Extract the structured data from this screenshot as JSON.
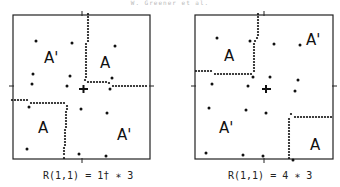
{
  "header": {
    "text": "W. Greener et al."
  },
  "panels": [
    {
      "id": "left",
      "caption": "R(1,1) = 1† ∗ 3",
      "regions": [
        {
          "label": "A'",
          "x": 44,
          "y": 58
        },
        {
          "label": "A",
          "x": 101,
          "y": 63
        },
        {
          "label": "A",
          "x": 40,
          "y": 131
        },
        {
          "label": "A'",
          "x": 117,
          "y": 138
        }
      ]
    },
    {
      "id": "right",
      "caption": "R(1,1) = 4 ∗ 3",
      "regions": [
        {
          "label": "A",
          "x": 225,
          "y": 63
        },
        {
          "label": "A'",
          "x": 305,
          "y": 45
        },
        {
          "label": "A'",
          "x": 219,
          "y": 131
        },
        {
          "label": "A",
          "x": 308,
          "y": 148
        }
      ]
    }
  ],
  "colors": {
    "ink": "#111111",
    "background": "#ffffff"
  }
}
